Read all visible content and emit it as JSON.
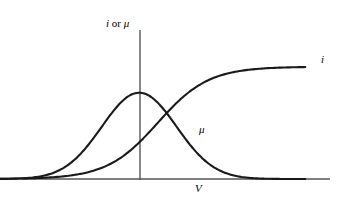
{
  "figure": {
    "background_color": "#ffffff",
    "width": 352,
    "height": 204,
    "line_color": "#1a1a1a",
    "axis_color": "#555555"
  },
  "labels": {
    "ylabel_italic_i": "i",
    "ylabel_or": " or ",
    "ylabel_mu": "μ",
    "xlabel": "V",
    "curve_i_label": "i",
    "curve_mu_label": "μ"
  },
  "chart_data": {
    "type": "line",
    "title": "",
    "subtitle": "",
    "xlabel": "V",
    "ylabel": "i or μ",
    "grid": false,
    "legend": "inline-curve-labels",
    "axes": {
      "x_axis_y_px": 179,
      "x_axis_start_px": 23,
      "x_axis_end_px": 330,
      "y_axis_x_px": 140,
      "y_axis_top_px": 30,
      "y_axis_bottom_px": 180,
      "xlim": [
        -3.6,
        4.2
      ],
      "ylim": [
        0,
        1.08
      ],
      "ticks": []
    },
    "annotations": [
      {
        "text": "i",
        "x_px": 324,
        "y_px": 60,
        "note": "label on saturating current curve"
      },
      {
        "text": "μ",
        "x_px": 202,
        "y_px": 130,
        "note": "label on falling side of bell curve"
      }
    ],
    "series": [
      {
        "name": "μ",
        "label": "μ",
        "shape": "gaussian",
        "color": "#1a1a1a",
        "peak_x": -0.02,
        "peak_y": 0.68,
        "sigma": 0.95,
        "x": [
          -3.6,
          -3.2,
          -2.8,
          -2.4,
          -2.0,
          -1.6,
          -1.2,
          -0.8,
          -0.4,
          0.0,
          0.4,
          0.8,
          1.2,
          1.6,
          2.0,
          2.4,
          2.8,
          3.2,
          3.6,
          4.2
        ],
        "values": [
          0.001,
          0.003,
          0.009,
          0.025,
          0.064,
          0.143,
          0.276,
          0.46,
          0.62,
          0.68,
          0.62,
          0.46,
          0.276,
          0.143,
          0.064,
          0.025,
          0.009,
          0.003,
          0.001,
          0.0
        ]
      },
      {
        "name": "i",
        "label": "i",
        "shape": "sigmoid",
        "color": "#1a1a1a",
        "midpoint_x": 0.45,
        "steepness": 1.55,
        "plateau_y": 0.885,
        "x": [
          -3.6,
          -3.2,
          -2.8,
          -2.4,
          -2.0,
          -1.6,
          -1.2,
          -0.8,
          -0.4,
          0.0,
          0.4,
          0.8,
          1.2,
          1.6,
          2.0,
          2.4,
          2.8,
          3.2,
          3.6,
          4.2
        ],
        "values": [
          0.001,
          0.002,
          0.004,
          0.008,
          0.016,
          0.032,
          0.063,
          0.117,
          0.204,
          0.325,
          0.47,
          0.613,
          0.729,
          0.81,
          0.855,
          0.873,
          0.881,
          0.884,
          0.885,
          0.885
        ]
      }
    ],
    "intersection": {
      "x_px": 170,
      "y_px": 93
    }
  }
}
